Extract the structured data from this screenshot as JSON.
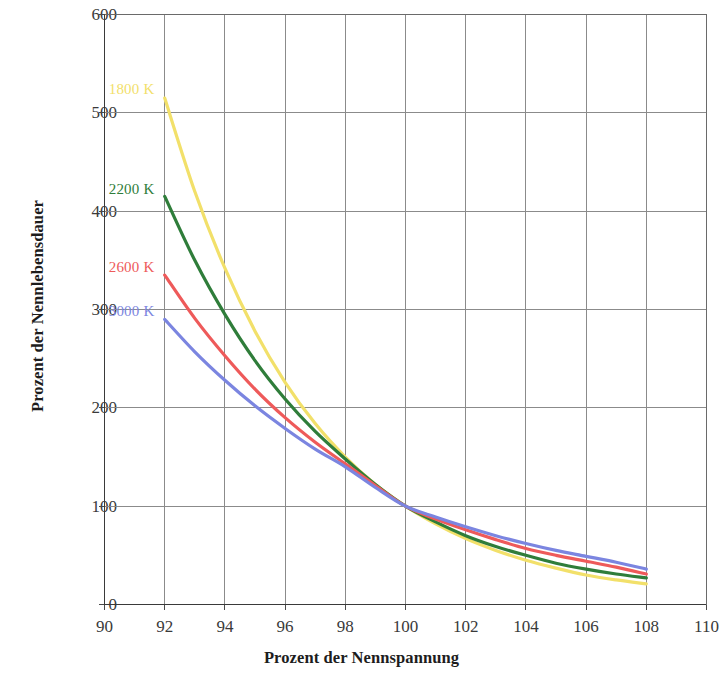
{
  "chart_data": {
    "type": "line",
    "title": "",
    "xlabel": "Prozent der Nennspannung",
    "ylabel": "Prozent der Nennlebensdauer",
    "xlim": [
      90,
      110
    ],
    "ylim": [
      0,
      600
    ],
    "xticks": [
      90,
      92,
      94,
      96,
      98,
      100,
      102,
      104,
      106,
      108,
      110
    ],
    "yticks": [
      0,
      100,
      200,
      300,
      400,
      500,
      600
    ],
    "grid": true,
    "legend_position": "inline-left",
    "x": [
      92,
      93,
      94,
      95,
      96,
      97,
      98,
      99,
      100,
      101,
      102,
      103,
      104,
      105,
      106,
      107,
      108
    ],
    "series": [
      {
        "name": "1800 K",
        "color": "#f2e06a",
        "label_x": 92,
        "label_y": 523,
        "values": [
          515,
          420,
          342,
          278,
          226,
          184,
          150,
          122,
          100,
          82,
          67,
          55,
          45,
          37,
          30,
          25,
          21
        ]
      },
      {
        "name": "2200 K",
        "color": "#2f7d3a",
        "label_x": 92,
        "label_y": 422,
        "values": [
          415,
          350,
          295,
          248,
          209,
          176,
          148,
          122,
          100,
          84,
          70,
          59,
          50,
          42,
          36,
          31,
          27
        ]
      },
      {
        "name": "2600 K",
        "color": "#ee5a5a",
        "label_x": 92,
        "label_y": 342,
        "values": [
          335,
          291,
          253,
          219,
          190,
          165,
          143,
          121,
          100,
          87,
          76,
          66,
          57,
          50,
          44,
          38,
          31
        ]
      },
      {
        "name": "3000 K",
        "color": "#7b85e0",
        "label_x": 92,
        "label_y": 297,
        "values": [
          290,
          257,
          228,
          202,
          179,
          158,
          140,
          119,
          100,
          89,
          79,
          70,
          62,
          55,
          49,
          43,
          36
        ]
      }
    ]
  },
  "axis": {
    "y_tick_labels": [
      "600",
      "500",
      "400",
      "300",
      "200",
      "100",
      "0"
    ],
    "x_tick_labels": [
      "90",
      "92",
      "94",
      "96",
      "98",
      "100",
      "102",
      "104",
      "106",
      "108",
      "110"
    ],
    "y_title": "Prozent der Nennlebensdauer",
    "x_title": "Prozent der Nennspannung"
  },
  "colors": {
    "series_1800k": "#f2e06a",
    "series_2200k": "#2f7d3a",
    "series_2600k": "#ee5a5a",
    "series_3000k": "#7b85e0",
    "grid": "#8b8b8b",
    "axis": "#4a4a4a",
    "text": "#2b2b2b"
  }
}
